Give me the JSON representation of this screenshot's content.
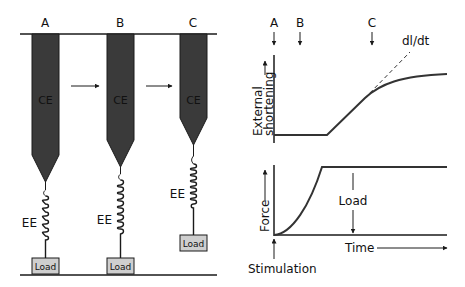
{
  "figure": {
    "type": "muscle contraction model diagram",
    "left_panel": {
      "states": [
        {
          "label": "A",
          "ce_label": "CE",
          "ee_label": "EE",
          "load_label": "Load"
        },
        {
          "label": "B",
          "ce_label": "CE",
          "ee_label": "EE",
          "load_label": "Load"
        },
        {
          "label": "C",
          "ce_label": "CE",
          "ee_label": "EE",
          "load_label": "Load"
        }
      ]
    },
    "top_chart": {
      "ylabel": "External shortening",
      "markers": [
        "A",
        "B",
        "C"
      ],
      "tangent_label": "dl/dt"
    },
    "bottom_chart": {
      "ylabel": "Force",
      "xlabel": "Time",
      "load_label": "Load",
      "stimulus_label": "Stimulation"
    },
    "colors": {
      "element_fill": "#3a3a3a",
      "load_fill": "#cfcfcf",
      "line": "#1a1a1a"
    }
  }
}
